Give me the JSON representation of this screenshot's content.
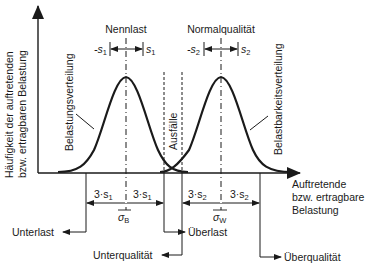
{
  "diagram": {
    "type": "stress-strength interference diagram",
    "y_axis_label_line1": "Häufigkeit der auftretenden",
    "y_axis_label_line2": "bzw. ertragbaren Belastung",
    "x_axis_label_line1": "Auftretende",
    "x_axis_label_line2": "bzw. ertragbare",
    "x_axis_label_line3": "Belastung",
    "curves": [
      {
        "name": "Belastungsverteilung",
        "center_label": "Nennlast",
        "minus_s": "-s",
        "plus_s": "s",
        "sub": "1",
        "mean_symbol": "σ",
        "mean_sub": "B",
        "left_span": "3·s",
        "right_span": "3·s"
      },
      {
        "name": "Belastbarkeitsverteilung",
        "center_label": "Normalqualität",
        "minus_s": "-s",
        "plus_s": "s",
        "sub": "2",
        "mean_symbol": "σ",
        "mean_sub": "W",
        "left_span": "3·s",
        "right_span": "3·s"
      }
    ],
    "overlap_label": "Ausfälle",
    "regions": {
      "unterlast": "Unterlast",
      "ueberlast": "Überlast",
      "unterqualitaet": "Unterqualität",
      "ueberqualitaet": "Überqualität"
    },
    "colors": {
      "line": "#1a1a1a",
      "background": "#ffffff"
    }
  }
}
